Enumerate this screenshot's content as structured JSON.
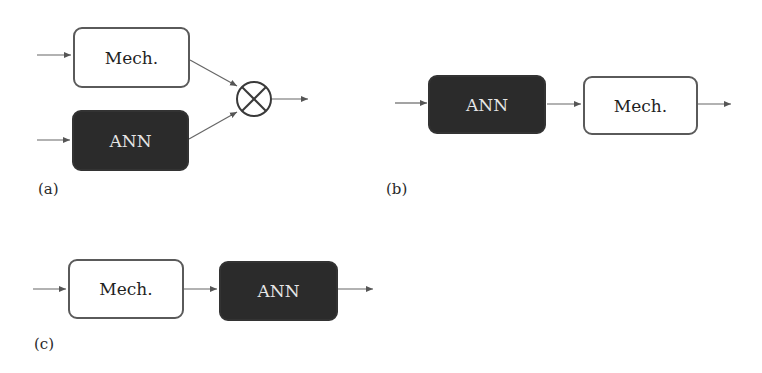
{
  "figure": {
    "panels": [
      {
        "id": "a",
        "label": "(a)",
        "description": "Parallel: Mech. and ANN outputs combined by multiplication junction",
        "blocks": [
          {
            "type": "mech",
            "text": "Mech."
          },
          {
            "type": "ann",
            "text": "ANN"
          }
        ],
        "junction": "multiply-circle"
      },
      {
        "id": "b",
        "label": "(b)",
        "description": "Series: ANN followed by Mech.",
        "blocks": [
          {
            "type": "ann",
            "text": "ANN"
          },
          {
            "type": "mech",
            "text": "Mech."
          }
        ]
      },
      {
        "id": "c",
        "label": "(c)",
        "description": "Series: Mech. followed by ANN",
        "blocks": [
          {
            "type": "mech",
            "text": "Mech."
          },
          {
            "type": "ann",
            "text": "ANN"
          }
        ]
      }
    ],
    "colors": {
      "mech_fill": "#ffffff",
      "mech_border": "#5a5a5a",
      "ann_fill": "#2b2b2b",
      "ann_text": "#e6e6e6",
      "arrow": "#555555"
    }
  }
}
